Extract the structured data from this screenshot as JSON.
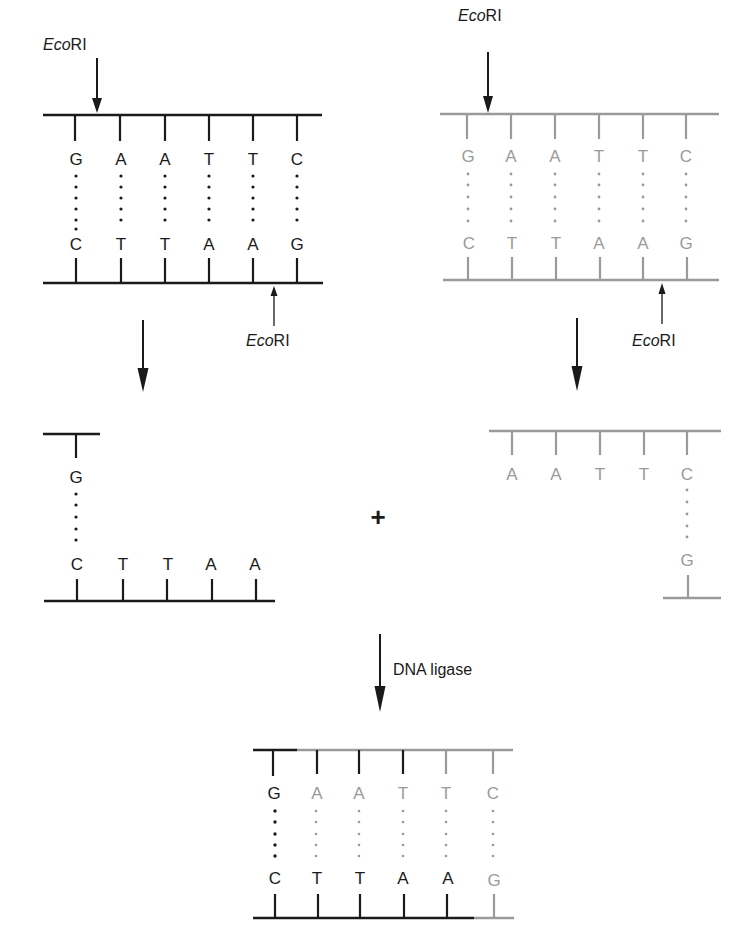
{
  "colors": {
    "dark": "#1a1a1a",
    "gray": "#9a9a9a",
    "background": "#ffffff"
  },
  "enzyme": {
    "name_italic": "Eco",
    "name_roman": "RI"
  },
  "labels": {
    "top_left_enzyme": "EcoRI",
    "bottom_left_enzyme": "EcoRI",
    "top_right_enzyme": "EcoRI",
    "bottom_right_enzyme": "EcoRI",
    "plus": "+",
    "ligase": "DNA ligase"
  },
  "panels": {
    "left_duplex": {
      "color": "dark",
      "top_strand": [
        "G",
        "A",
        "A",
        "T",
        "T",
        "C"
      ],
      "bottom_strand": [
        "C",
        "T",
        "T",
        "A",
        "A",
        "G"
      ]
    },
    "right_duplex": {
      "color": "gray",
      "top_strand": [
        "G",
        "A",
        "A",
        "T",
        "T",
        "C"
      ],
      "bottom_strand": [
        "C",
        "T",
        "T",
        "A",
        "A",
        "G"
      ]
    },
    "left_fragment": {
      "color": "dark",
      "top_strand": [
        "G"
      ],
      "bottom_strand": [
        "C",
        "T",
        "T",
        "A",
        "A"
      ]
    },
    "right_fragment": {
      "color": "gray",
      "top_strand": [
        "A",
        "A",
        "T",
        "T",
        "C"
      ],
      "bottom_strand": [
        "G"
      ]
    },
    "ligated_product": {
      "top_strand": [
        {
          "base": "G",
          "color": "dark"
        },
        {
          "base": "A",
          "color": "gray"
        },
        {
          "base": "A",
          "color": "gray"
        },
        {
          "base": "T",
          "color": "gray"
        },
        {
          "base": "T",
          "color": "gray"
        },
        {
          "base": "C",
          "color": "gray"
        }
      ],
      "bottom_strand": [
        {
          "base": "C",
          "color": "dark"
        },
        {
          "base": "T",
          "color": "dark"
        },
        {
          "base": "T",
          "color": "dark"
        },
        {
          "base": "A",
          "color": "dark"
        },
        {
          "base": "A",
          "color": "dark"
        },
        {
          "base": "G",
          "color": "gray"
        }
      ]
    }
  }
}
